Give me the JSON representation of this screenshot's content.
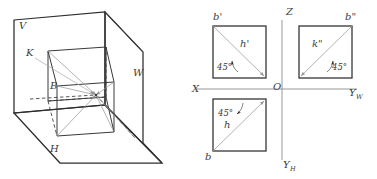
{
  "figure": {
    "background_color": "#ffffff",
    "ink_color": "#2e2e2e",
    "gray_color": "#9a9a9a"
  },
  "pictorial": {
    "name": "three-plane-projection-box",
    "plane_labels": [
      {
        "id": "V",
        "text": "V",
        "x": 19,
        "y": 29
      },
      {
        "id": "W",
        "text": "W",
        "x": 133,
        "y": 76
      },
      {
        "id": "H",
        "text": "H",
        "x": 50,
        "y": 152
      }
    ],
    "point_labels": [
      {
        "id": "K",
        "text": "K",
        "x": 26,
        "y": 56
      },
      {
        "id": "B",
        "text": "B",
        "x": 50,
        "y": 89
      }
    ]
  },
  "projection": {
    "name": "three-view-orthographic-layout",
    "axes": [
      {
        "id": "X",
        "text": "X",
        "sub": "",
        "x": 192,
        "y": 92
      },
      {
        "id": "Z",
        "text": "Z",
        "sub": "",
        "x": 286,
        "y": 15
      },
      {
        "id": "O",
        "text": "O",
        "sub": "",
        "x": 275,
        "y": 90
      },
      {
        "id": "YW",
        "text": "Y",
        "sub": "W",
        "x": 352,
        "y": 94
      },
      {
        "id": "YH",
        "text": "Y",
        "sub": "H",
        "x": 285,
        "y": 166
      }
    ],
    "views": [
      {
        "id": "front-view",
        "name": "front-view-square",
        "corner_label": "b'",
        "diagonal_label": "h'",
        "angle_label": "45°"
      },
      {
        "id": "side-view",
        "name": "side-view-square",
        "corner_label": "b\"",
        "diagonal_label": "k\"",
        "angle_label": "45°"
      },
      {
        "id": "top-view",
        "name": "top-view-square",
        "corner_label": "b",
        "diagonal_label": "h",
        "angle_label": "45°"
      }
    ]
  }
}
